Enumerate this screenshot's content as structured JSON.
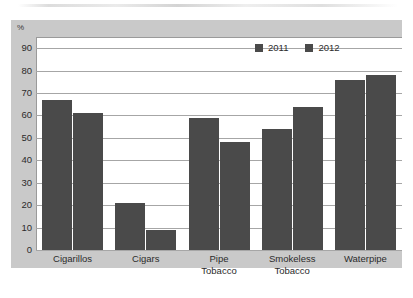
{
  "chart_data": {
    "type": "bar",
    "title": "",
    "xlabel": "",
    "ylabel": "%",
    "ylim": [
      0,
      95
    ],
    "yticks": [
      0,
      10,
      20,
      30,
      40,
      50,
      60,
      70,
      80,
      90
    ],
    "grid": true,
    "legend_position": "top-right",
    "categories": [
      "Cigarillos",
      "Cigars",
      "Pipe Tobacco",
      "Smokeless Tobacco",
      "Waterpipe"
    ],
    "category_lines": [
      [
        "Cigarillos"
      ],
      [
        "Cigars"
      ],
      [
        "Pipe",
        "Tobacco"
      ],
      [
        "Smokeless",
        "Tobacco"
      ],
      [
        "Waterpipe"
      ]
    ],
    "series": [
      {
        "name": "2011",
        "color": "#4a4a4a",
        "values": [
          67,
          21,
          59,
          54,
          76
        ]
      },
      {
        "name": "2012",
        "color": "#4a4a4a",
        "values": [
          61,
          9,
          48,
          64,
          78
        ]
      }
    ]
  },
  "colors": {
    "bar": "#4a4a4a",
    "grid": "#a6a6a6",
    "frame_band": "#c9c9c9",
    "plot_background": "#ffffff",
    "text": "#2b2b2b"
  }
}
